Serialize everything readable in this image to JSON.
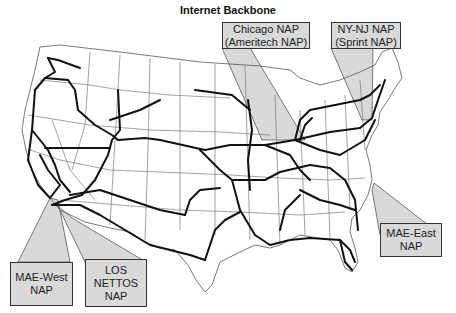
{
  "title": "Internet Backbone",
  "colors": {
    "callout_fill": "#d9d9d9",
    "backbone_line": "#111111",
    "state_border": "#555555",
    "background": "#ffffff"
  },
  "callouts": [
    {
      "id": "chicago",
      "lines": [
        "Chicago NAP",
        "(Ameritech NAP)"
      ]
    },
    {
      "id": "nynj",
      "lines": [
        "NY-NJ NAP",
        "(Sprint NAP)"
      ]
    },
    {
      "id": "maewest",
      "lines": [
        "MAE-West",
        "NAP"
      ]
    },
    {
      "id": "losnettos",
      "lines": [
        "LOS",
        "NETTOS",
        "NAP"
      ]
    },
    {
      "id": "maeeast",
      "lines": [
        "MAE-East",
        "NAP"
      ]
    }
  ]
}
